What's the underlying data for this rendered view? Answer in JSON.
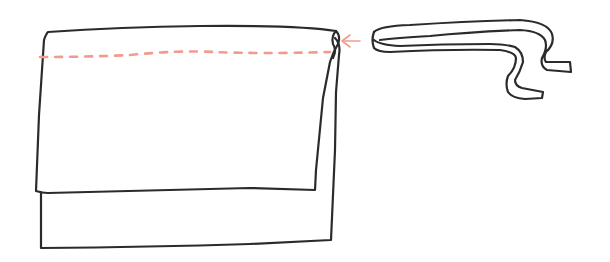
{
  "diagram": {
    "title": "",
    "elements": [
      {
        "id": "fabric-back-panel",
        "type": "shape"
      },
      {
        "id": "fabric-folded-flap",
        "type": "shape"
      },
      {
        "id": "stitch-line",
        "type": "dashed-line",
        "color": "#f29a8e"
      },
      {
        "id": "insert-arrow",
        "type": "arrow",
        "color": "#f29a8e"
      },
      {
        "id": "ribbon-tie",
        "type": "shape"
      }
    ],
    "colors": {
      "ink": "#2b2b2b",
      "stitch": "#f29a8e",
      "background": "#ffffff"
    }
  }
}
